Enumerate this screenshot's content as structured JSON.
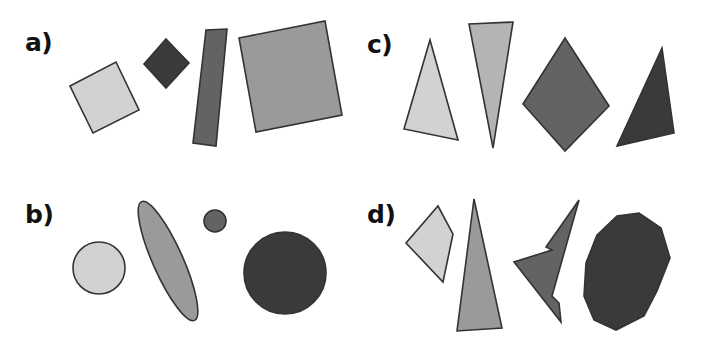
{
  "figure": {
    "width": 706,
    "height": 352,
    "background": "#ffffff",
    "outline_color": "#333333"
  },
  "panels": [
    {
      "id": "a",
      "label": "a)",
      "label_x": 25,
      "label_y": 28,
      "description": "quadrilaterals: squares, diamond, thin rectangle"
    },
    {
      "id": "b",
      "label": "b)",
      "label_x": 25,
      "label_y": 200,
      "description": "ellipses and circles"
    },
    {
      "id": "c",
      "label": "c)",
      "label_x": 367,
      "label_y": 30,
      "description": "triangles and diamond"
    },
    {
      "id": "d",
      "label": "d)",
      "label_x": 367,
      "label_y": 200,
      "description": "irregular polygons"
    }
  ],
  "palette": {
    "light_gray": "#d2d2d2",
    "mid_light_gray": "#b4b4b4",
    "mid_gray": "#9a9a9a",
    "gray": "#7f7f7f",
    "dark_gray": "#636363",
    "darker_gray": "#565656",
    "near_black": "#3a3a3a",
    "black_shape": "#333333"
  },
  "chart_data": {
    "type": "scatter",
    "title": "",
    "xlabel": "",
    "ylabel": "",
    "shapes": [
      {
        "panel": "a",
        "index": 1,
        "kind": "square",
        "fill": "#d2d2d2",
        "points": "70,86 116,62 139,110 93,133"
      },
      {
        "panel": "a",
        "index": 2,
        "kind": "diamond",
        "fill": "#3a3a3a",
        "points": "166,39 189,63 166,88 144,64"
      },
      {
        "panel": "a",
        "index": 3,
        "kind": "rectangle",
        "fill": "#636363",
        "points": "206,30 227,29 216,146 193,143"
      },
      {
        "panel": "a",
        "index": 4,
        "kind": "square",
        "fill": "#9a9a9a",
        "points": "239,38 325,21 342,115 256,132"
      },
      {
        "panel": "b",
        "index": 1,
        "kind": "circle",
        "fill": "#d2d2d2",
        "cx": 99,
        "cy": 268,
        "r": 26
      },
      {
        "panel": "b",
        "index": 2,
        "kind": "ellipse",
        "fill": "#9a9a9a",
        "cx": 168,
        "cy": 261,
        "rx": 15,
        "ry": 65,
        "rotation": -24
      },
      {
        "panel": "b",
        "index": 3,
        "kind": "circle",
        "fill": "#636363",
        "cx": 215,
        "cy": 221,
        "r": 11
      },
      {
        "panel": "b",
        "index": 4,
        "kind": "circle",
        "fill": "#3a3a3a",
        "cx": 285,
        "cy": 273,
        "r": 41
      },
      {
        "panel": "c",
        "index": 1,
        "kind": "triangle",
        "fill": "#d2d2d2",
        "points": "430,40 458,140 404,129"
      },
      {
        "panel": "c",
        "index": 2,
        "kind": "triangle",
        "fill": "#b4b4b4",
        "points": "469,24 513,22 493,148"
      },
      {
        "panel": "c",
        "index": 3,
        "kind": "diamond",
        "fill": "#636363",
        "points": "565,38 609,106 565,151 523,104"
      },
      {
        "panel": "c",
        "index": 4,
        "kind": "triangle",
        "fill": "#3a3a3a",
        "points": "662,48 674,133 617,146"
      },
      {
        "panel": "d",
        "index": 1,
        "kind": "quadrilateral",
        "fill": "#d2d2d2",
        "points": "438,206 453,234 443,282 406,243"
      },
      {
        "panel": "d",
        "index": 2,
        "kind": "triangle",
        "fill": "#9a9a9a",
        "points": "474,199 502,328 457,331"
      },
      {
        "panel": "d",
        "index": 3,
        "kind": "arrow-polygon",
        "fill": "#636363",
        "points": "579,200 552,296 559,303 561,322 514,262 552,250 546,247"
      },
      {
        "panel": "d",
        "index": 4,
        "kind": "blob-polygon",
        "fill": "#3a3a3a",
        "points": "597,235 617,216 639,213 661,228 670,258 657,291 644,316 616,330 594,320 584,296 586,263"
      }
    ]
  }
}
